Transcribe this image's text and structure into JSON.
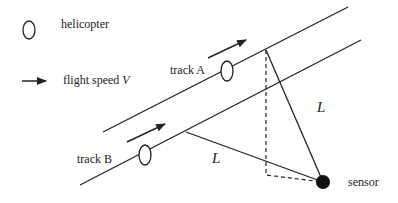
{
  "legend": {
    "helicopter_label": "helicopter",
    "flight_speed_label": "flight speed",
    "flight_speed_symbol": "V"
  },
  "tracks": [
    {
      "label": "track A"
    },
    {
      "label": "track B"
    }
  ],
  "distance_labels": [
    "L",
    "L"
  ],
  "sensor_label": "sensor",
  "colors": {
    "line": "#222222",
    "background": "#ffffff"
  }
}
